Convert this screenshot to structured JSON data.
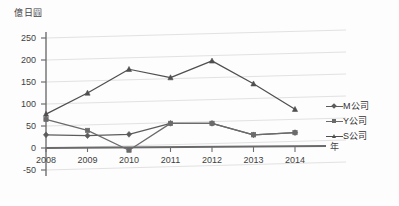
{
  "chart_data": {
    "type": "line",
    "title": "",
    "subtitle": "",
    "xlabel": "年",
    "ylabel": "億日圓",
    "categories": [
      "2008",
      "2009",
      "2010",
      "2011",
      "2012",
      "2013",
      "2014"
    ],
    "x": [
      2008,
      2009,
      2010,
      2011,
      2012,
      2013,
      2014
    ],
    "ylim": [
      -50,
      250
    ],
    "yticks": [
      "250",
      "200",
      "150",
      "100",
      "50",
      "0",
      "-50"
    ],
    "ytick_values": [
      250,
      200,
      150,
      100,
      50,
      0,
      -50
    ],
    "grid": true,
    "legend_position": "right",
    "series": [
      {
        "name": "M公司",
        "marker": "diamond",
        "color": "#5c5c5c",
        "values": [
          30,
          28,
          31,
          56,
          56,
          30,
          35
        ]
      },
      {
        "name": "Y公司",
        "marker": "square",
        "color": "#6b6b6b",
        "values": [
          65,
          40,
          -5,
          56,
          56,
          30,
          35
        ]
      },
      {
        "name": "S公司",
        "marker": "triangle",
        "color": "#4f4f4f",
        "values": [
          77,
          125,
          179,
          160,
          198,
          146,
          88
        ]
      }
    ]
  },
  "axis": {
    "y_unit_caption": "億日圓",
    "x_axis_name": "年"
  },
  "colors": {
    "axis": "#6e6e6e",
    "gridline": "#e2e2e2",
    "plot_background": "#fdfdfd",
    "text": "#3b3b3b"
  }
}
